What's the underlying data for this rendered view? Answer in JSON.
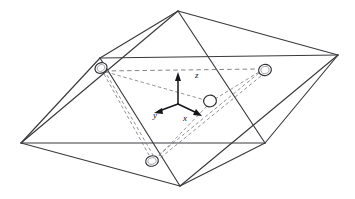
{
  "figure": {
    "name": "bipyramid-coordination-polyhedron",
    "background_color": "#ffffff",
    "line_color": "#3a3a3e",
    "dashed_color": "#6d6d74",
    "atom_fill": "#ffffff",
    "atom_stroke": "#2f2f34",
    "axis_color": "#15151a",
    "width": 355,
    "height": 199
  },
  "axes": {
    "origin": {
      "x": 178,
      "y": 104
    },
    "z": {
      "label": "z",
      "label_x": 196,
      "label_y": 78,
      "tip_x": 178,
      "tip_y": 74
    },
    "x": {
      "label": "x",
      "label_x": 185,
      "label_y": 120,
      "tip_x": 200,
      "tip_y": 114
    },
    "y": {
      "label": "y",
      "label_x": 155,
      "label_y": 118,
      "tip_x": 156,
      "tip_y": 112
    }
  },
  "atoms": [
    {
      "id": "atom-upper-left",
      "cx": 101,
      "cy": 68,
      "rx": 6.2,
      "ry": 5.2,
      "rotation": -28
    },
    {
      "id": "atom-upper-right",
      "cx": 265,
      "cy": 70,
      "rx": 6.4,
      "ry": 5.6,
      "rotation": -12
    },
    {
      "id": "atom-center",
      "cx": 210,
      "cy": 101,
      "rx": 6.4,
      "ry": 5.8,
      "rotation": -8
    },
    {
      "id": "atom-lower",
      "cx": 152,
      "cy": 161,
      "rx": 6.4,
      "ry": 5.2,
      "rotation": -14
    }
  ],
  "vertices": {
    "top": {
      "x": 178,
      "y": 11
    },
    "bottom": {
      "x": 180,
      "y": 186
    },
    "left": {
      "x": 21,
      "y": 143
    },
    "right": {
      "x": 338,
      "y": 55
    },
    "mid_left": {
      "x": 100,
      "y": 58
    },
    "mid_right": {
      "x": 265,
      "y": 143
    },
    "upper_band_l": {
      "x": 100,
      "y": 58
    },
    "upper_band_r": {
      "x": 338,
      "y": 55
    },
    "lower_band_l": {
      "x": 21,
      "y": 143
    },
    "lower_band_r": {
      "x": 265,
      "y": 143
    }
  },
  "caption": {
    "title": "",
    "subtitle": ""
  }
}
